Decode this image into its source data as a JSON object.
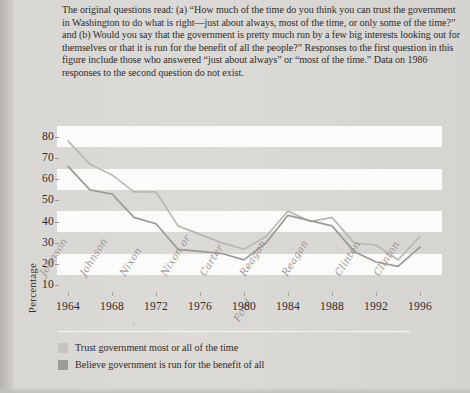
{
  "caption": {
    "text": "The original questions read: (a) “How much of the time do you think you can trust the government in Washington to do what is right—just about always, most of the time, or only some of the time?” and (b) Would you say that the government is pretty much run by a few big interests looking out for themselves or that it is run for the benefit of all the people?” Responses to the first question in this figure include those who answered “just about always” or “most of the time.” Data on 1986 responses to the second question do not exist."
  },
  "legend": {
    "items": [
      {
        "label": "Trust government most or all of the time",
        "color": "#c6c4c0"
      },
      {
        "label": "Believe government is run for the benefit of all",
        "color": "#9e9c98"
      }
    ]
  },
  "annotations": [
    {
      "name": "Johnson",
      "x": 1965.0
    },
    {
      "name": "Johnson",
      "x": 1968.6
    },
    {
      "name": "Nixon",
      "x": 1972.3
    },
    {
      "name": "Nixon or",
      "name2": "Ford",
      "x": 1976.0
    },
    {
      "name": "Carter",
      "x": 1979.5
    },
    {
      "name": "Reagan",
      "x": 1983.2
    },
    {
      "name": "Reagan",
      "x": 1987.0
    },
    {
      "name": "Clinton",
      "x": 1991.8
    },
    {
      "name": "Clinton",
      "x": 1995.4
    }
  ],
  "chart_data": {
    "type": "line",
    "title": "",
    "xlabel": "",
    "ylabel": "Percentage",
    "xlim": [
      1963,
      1998
    ],
    "ylim": [
      5,
      85
    ],
    "yticks": [
      80,
      70,
      60,
      50,
      40,
      30,
      20,
      10
    ],
    "xticks": [
      1964,
      1968,
      1972,
      1976,
      1980,
      1984,
      1988,
      1992,
      1996
    ],
    "grid": "alternating-horizontal-bands",
    "legend_position": "below",
    "series": [
      {
        "name": "Trust government most or all of the time",
        "color": "#b9b7b3",
        "x": [
          1964,
          1966,
          1968,
          1970,
          1972,
          1974,
          1976,
          1978,
          1980,
          1982,
          1984,
          1986,
          1988,
          1990,
          1992,
          1994,
          1996
        ],
        "values": [
          78,
          67,
          62,
          54,
          54,
          38,
          34,
          30,
          27,
          33,
          45,
          40,
          42,
          30,
          29,
          22,
          33
        ]
      },
      {
        "name": "Believe government is run for the benefit of all",
        "color": "#9c9a96",
        "x": [
          1964,
          1966,
          1968,
          1970,
          1972,
          1974,
          1976,
          1978,
          1980,
          1982,
          1984,
          1988,
          1990,
          1992,
          1994,
          1996
        ],
        "values": [
          66,
          55,
          53,
          42,
          39,
          27,
          26,
          25,
          22,
          30,
          43,
          38,
          26,
          21,
          19,
          28
        ]
      }
    ]
  }
}
